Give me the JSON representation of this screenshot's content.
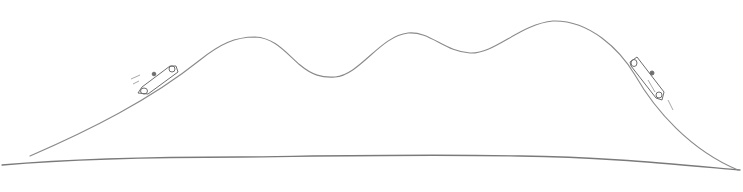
{
  "sketch": {
    "description": "Hand-drawn pencil sketch of a roller-coaster-like hilly track with two cars, one climbing left slope and one descending right slope, above a ground line",
    "colors": {
      "background": "#ffffff",
      "stroke_track": "#8a8a8a",
      "stroke_ground": "#7a7a7a",
      "stroke_car": "#6e6e6e"
    },
    "track": {
      "peaks": [
        {
          "x": 245,
          "y": 37
        },
        {
          "x": 410,
          "y": 33
        },
        {
          "x": 555,
          "y": 21
        }
      ],
      "valleys": [
        {
          "x": 330,
          "y": 77
        },
        {
          "x": 475,
          "y": 53
        }
      ]
    },
    "cars": [
      {
        "name": "car-left",
        "x": 155,
        "y": 80,
        "direction": "uphill"
      },
      {
        "name": "car-right",
        "x": 648,
        "y": 78,
        "direction": "downhill"
      }
    ]
  }
}
